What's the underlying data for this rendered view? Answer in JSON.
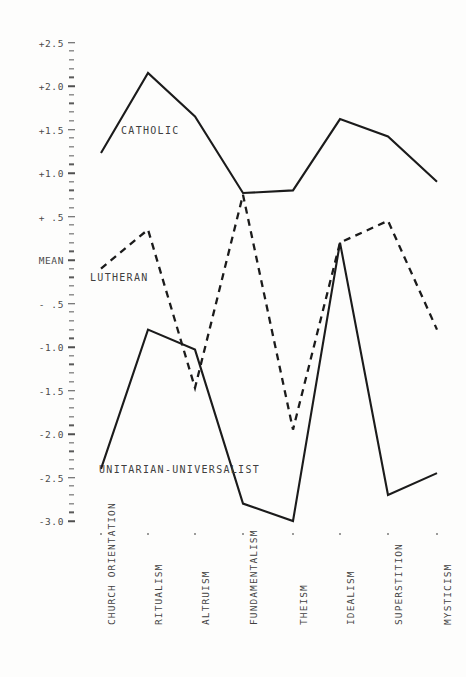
{
  "chart_data": {
    "type": "line",
    "title": "",
    "xlabel": "",
    "ylabel": "MEAN",
    "ylim": [
      -3.0,
      2.5
    ],
    "grid": false,
    "legend": "inline-labels",
    "categories": [
      "CHURCH ORIENTATION",
      "RITUALISM",
      "ALTRUISM",
      "FUNDAMENTALISM",
      "THEISM",
      "IDEALISM",
      "SUPERSTITION",
      "MYSTICISM"
    ],
    "ytick_labels": [
      "+2.5",
      "+2.0",
      "+1.5",
      "+1.0",
      "+ .5",
      "MEAN",
      "- .5",
      "-1.0",
      "-1.5",
      "-2.0",
      "-2.5",
      "-3.0"
    ],
    "ytick_values": [
      2.5,
      2.0,
      1.5,
      1.0,
      0.5,
      0.0,
      -0.5,
      -1.0,
      -1.5,
      -2.0,
      -2.5,
      -3.0
    ],
    "series": [
      {
        "name": "CATHOLIC",
        "style": "solid",
        "color": "#1b1b1b",
        "values": [
          1.23,
          2.15,
          1.65,
          0.77,
          0.8,
          1.62,
          1.42,
          0.9
        ]
      },
      {
        "name": "LUTHERAN",
        "style": "dashed",
        "color": "#1b1b1b",
        "values": [
          -0.1,
          0.35,
          -1.47,
          0.75,
          -1.95,
          0.2,
          0.45,
          -0.8
        ]
      },
      {
        "name": "UNITARIAN-UNIVERSALIST",
        "style": "solid",
        "color": "#1b1b1b",
        "values": [
          -2.4,
          -0.8,
          -1.03,
          -2.8,
          -3.0,
          0.2,
          -2.7,
          -2.45
        ]
      }
    ],
    "annotations": [
      {
        "text": "CATHOLIC",
        "x_px": 121,
        "y_px": 125
      },
      {
        "text": "LUTHERAN",
        "x_px": 90,
        "y_px": 272
      },
      {
        "text": "UNITARIAN-UNIVERSALIST",
        "x_px": 99,
        "y_px": 464
      }
    ]
  },
  "layout": {
    "x_positions": [
      101,
      148,
      195,
      243,
      293,
      340,
      388,
      437
    ],
    "y_zero_px": 260,
    "px_per_unit": 87.0
  }
}
